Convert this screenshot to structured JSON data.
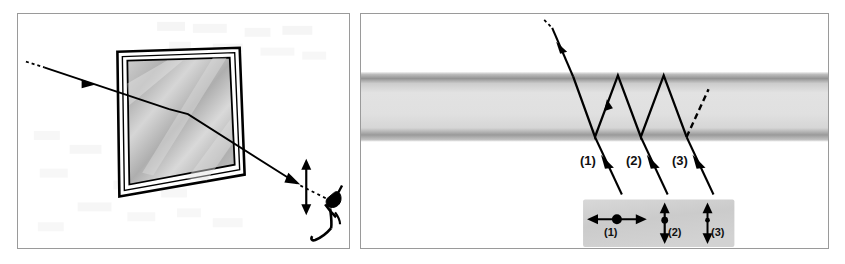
{
  "figure": {
    "panels": [
      {
        "id": "left",
        "name": "reflection-from-window-panel"
      },
      {
        "id": "right",
        "name": "multiple-internal-reflection-panel"
      }
    ]
  },
  "left_panel": {
    "name": "window-reflection-scene",
    "window": {
      "label": "glass-window-pane",
      "frame_color": "#000000",
      "glass_fill": "#bdbdbd"
    },
    "incident_ray": {
      "label": "incident-ray",
      "style": "solid-with-dashed-tail",
      "arrow": "midpoint-arrowhead"
    },
    "reflected_ray": {
      "label": "reflected-ray-to-observer",
      "style": "solid-with-dashed-tail"
    },
    "polarization_marker": {
      "label": "vertical-double-arrow",
      "orientation": "vertical",
      "meaning": "polarization direction"
    },
    "observer": {
      "label": "observer-figure"
    }
  },
  "right_panel": {
    "name": "glass-slab-multiple-reflection-scene",
    "slab": {
      "label": "glass-slab",
      "fill": "#dcdcdc",
      "edge_band_color": "#8e8e8e",
      "top_y": 74,
      "bottom_y": 137
    },
    "incident_ray": {
      "label": "incident-ray",
      "style": "solid-with-dashed-tail",
      "arrow": "midpoint-arrowhead"
    },
    "internal_path": {
      "label": "zigzag-internal-reflection-path",
      "bounces": 5
    },
    "dashed_exit_ray": {
      "label": "dashed-partially-reflected-ray"
    },
    "transmitted_rays": [
      {
        "name": "transmitted-ray-1",
        "label": "(1)"
      },
      {
        "name": "transmitted-ray-2",
        "label": "(2)"
      },
      {
        "name": "transmitted-ray-3",
        "label": "(3)"
      }
    ],
    "inset": {
      "name": "polarization-states-inset",
      "background": "#cfcfcf",
      "states": [
        {
          "name": "polarization-state-1",
          "label": "(1)",
          "type": "horizontal-double-arrow-with-dot",
          "orientation": "horizontal"
        },
        {
          "name": "polarization-state-2",
          "label": "(2)",
          "type": "vertical-double-arrow-with-dot",
          "orientation": "vertical"
        },
        {
          "name": "polarization-state-3",
          "label": "(3)",
          "type": "vertical-double-arrow-with-small-dot",
          "orientation": "vertical"
        }
      ]
    }
  },
  "colors": {
    "ink": "#000000",
    "panel_border": "#9a9a9a",
    "glass_gray": "#bdbdbd",
    "slab_gray": "#dcdcdc",
    "slab_edge": "#8e8e8e",
    "inset_gray": "#cfcfcf"
  }
}
